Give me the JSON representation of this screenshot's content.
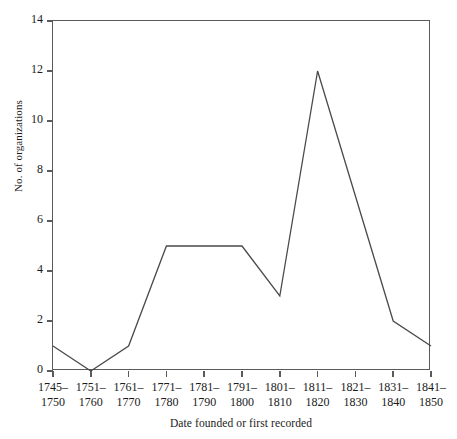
{
  "chart_data": {
    "type": "line",
    "title": "",
    "xlabel": "Date founded or first recorded",
    "ylabel": "No. of organizations",
    "categories": [
      "1745–\n1750",
      "1751–\n1760",
      "1761–\n1770",
      "1771–\n1780",
      "1781–\n1790",
      "1791–\n1800",
      "1801–\n1810",
      "1811–\n1820",
      "1821–\n1830",
      "1831–\n1840",
      "1841–\n1850"
    ],
    "values": [
      1,
      0,
      1,
      5,
      5,
      5,
      3,
      12,
      7,
      2,
      1
    ],
    "ylim": [
      0,
      14
    ],
    "yticks": [
      0,
      2,
      4,
      6,
      8,
      10,
      12,
      14
    ],
    "ytick_labels": [
      "0",
      "2",
      "4",
      "6",
      "8",
      "10",
      "12",
      "14"
    ],
    "grid": false,
    "legend": false,
    "line_color": "#4a4a4a",
    "frame_color": "#5a5a5a"
  }
}
